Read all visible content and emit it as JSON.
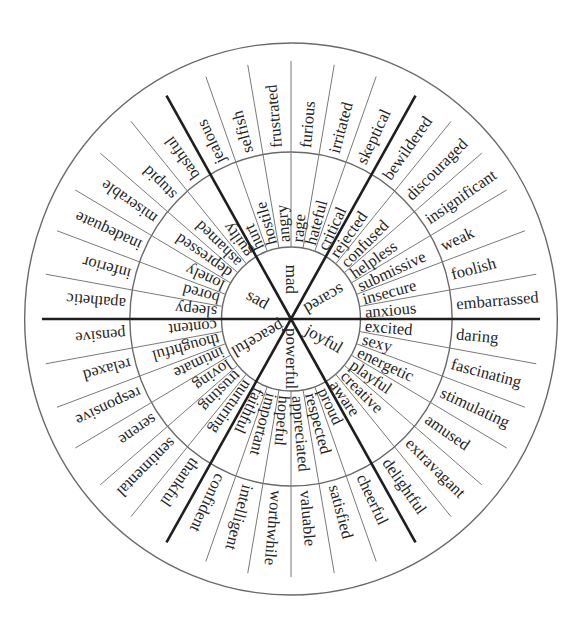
{
  "colors": {
    "background": "#ffffff",
    "ring_stroke": "#6a6a6a",
    "divider": "#7a7a7a",
    "sector_line": "#1e1e1e",
    "text": "#262626"
  },
  "geometry": {
    "center": [
      291,
      319
    ],
    "rx_scale": 0.965,
    "r_inner": 72,
    "r_middle": 167,
    "r_outer": 276,
    "divider_end_ratio": 0.935,
    "sector_degrees": 60,
    "slice_degrees": 10
  },
  "sectors": [
    {
      "name": "scared",
      "start_angle": 0,
      "label_orientation": "inward",
      "middle": [
        "anxious",
        "insecure",
        "submissive",
        "helpless",
        "confused",
        "rejected"
      ],
      "outer": [
        "embarrassed",
        "foolish",
        "weak",
        "insignificant",
        "discouraged",
        "bewildered"
      ]
    },
    {
      "name": "mad",
      "start_angle": 60,
      "label_orientation": "inward",
      "middle": [
        "critical",
        "hateful",
        "rage",
        "angry",
        "hostile",
        "hurt"
      ],
      "outer": [
        "skeptical",
        "irritated",
        "furious",
        "frustrated",
        "selfish",
        "jealous"
      ]
    },
    {
      "name": "sad",
      "start_angle": 120,
      "label_orientation": "inward",
      "middle": [
        "guilty",
        "ashamed",
        "depressed",
        "lonely",
        "bored",
        "sleepy"
      ],
      "outer": [
        "bashful",
        "stupid",
        "miserable",
        "inadequate",
        "inferior",
        "apathetic"
      ]
    },
    {
      "name": "peaceful",
      "start_angle": 180,
      "label_orientation": "outward",
      "middle": [
        "content",
        "thoughtful",
        "intimate",
        "loving",
        "trusting",
        "nurturing"
      ],
      "outer": [
        "pensive",
        "relaxed",
        "responsive",
        "serene",
        "sentimental",
        "thankful"
      ]
    },
    {
      "name": "powerful",
      "start_angle": 240,
      "label_orientation": "outward",
      "middle": [
        "faithful",
        "important",
        "hopeful",
        "appreciated",
        "respected",
        "proud"
      ],
      "outer": [
        "confident",
        "intelligent",
        "worthwhile",
        "valuable",
        "satisfied",
        "cheerful"
      ]
    },
    {
      "name": "joyful",
      "start_angle": 300,
      "label_orientation": "outward",
      "middle": [
        "aware",
        "creative",
        "playful",
        "energetic",
        "sexy",
        "excited"
      ],
      "outer": [
        "delightful",
        "extravagant",
        "amused",
        "stimulating",
        "fascinating",
        "daring"
      ]
    }
  ]
}
